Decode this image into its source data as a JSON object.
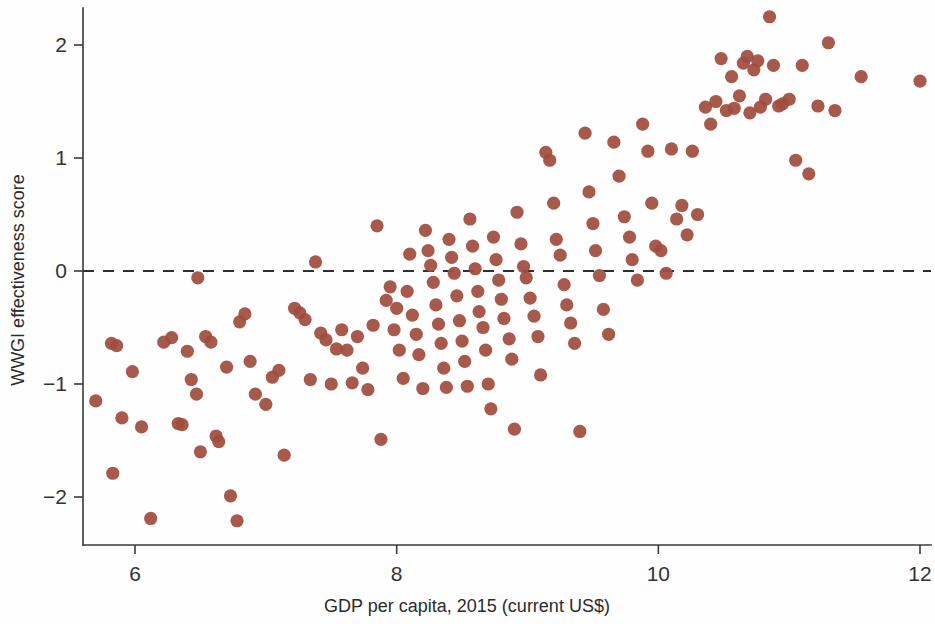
{
  "figure": {
    "background_color": "#fefefe",
    "point_color": "#a04c3d",
    "axis_color": "#3a3a3a",
    "point_radius": 6.6
  },
  "chart_data": {
    "type": "scatter",
    "title": "",
    "xlabel": "GDP per capita, 2015 (current US$)",
    "ylabel": "WWGI effectiveness score",
    "xlim": [
      5.6,
      12.1
    ],
    "ylim": [
      -2.35,
      2.45
    ],
    "xticks": [
      6,
      8,
      10,
      12
    ],
    "xtick_labels": [
      "6",
      "8",
      "10",
      "12"
    ],
    "yticks": [
      -2,
      -1,
      0,
      1,
      2
    ],
    "ytick_labels": [
      "−2",
      "−1",
      "0",
      "1",
      "2"
    ],
    "grid": false,
    "legend": null,
    "annotations": [
      {
        "type": "hline",
        "y": 0,
        "style": "dashed",
        "label": "zero reference line"
      }
    ],
    "series": [
      {
        "name": "Countries",
        "marker": "circle",
        "color": "#a04c3d",
        "points": [
          [
            5.7,
            -1.15
          ],
          [
            5.82,
            -0.64
          ],
          [
            5.86,
            -0.66
          ],
          [
            5.83,
            -1.79
          ],
          [
            5.9,
            -1.3
          ],
          [
            5.98,
            -0.89
          ],
          [
            6.05,
            -1.38
          ],
          [
            6.12,
            -2.19
          ],
          [
            6.22,
            -0.63
          ],
          [
            6.28,
            -0.59
          ],
          [
            6.33,
            -1.35
          ],
          [
            6.36,
            -1.36
          ],
          [
            6.4,
            -0.71
          ],
          [
            6.43,
            -0.96
          ],
          [
            6.48,
            -0.06
          ],
          [
            6.47,
            -1.09
          ],
          [
            6.5,
            -1.6
          ],
          [
            6.54,
            -0.58
          ],
          [
            6.58,
            -0.63
          ],
          [
            6.62,
            -1.46
          ],
          [
            6.64,
            -1.51
          ],
          [
            6.7,
            -0.85
          ],
          [
            6.73,
            -1.99
          ],
          [
            6.78,
            -2.21
          ],
          [
            6.8,
            -0.45
          ],
          [
            6.84,
            -0.38
          ],
          [
            6.88,
            -0.8
          ],
          [
            6.92,
            -1.09
          ],
          [
            7.0,
            -1.18
          ],
          [
            7.05,
            -0.94
          ],
          [
            7.1,
            -0.88
          ],
          [
            7.14,
            -1.63
          ],
          [
            7.22,
            -0.33
          ],
          [
            7.26,
            -0.37
          ],
          [
            7.3,
            -0.43
          ],
          [
            7.34,
            -0.96
          ],
          [
            7.38,
            0.08
          ],
          [
            7.42,
            -0.55
          ],
          [
            7.46,
            -0.61
          ],
          [
            7.5,
            -1.0
          ],
          [
            7.54,
            -0.69
          ],
          [
            7.58,
            -0.52
          ],
          [
            7.62,
            -0.7
          ],
          [
            7.66,
            -0.99
          ],
          [
            7.7,
            -0.58
          ],
          [
            7.74,
            -0.86
          ],
          [
            7.78,
            -1.05
          ],
          [
            7.82,
            -0.48
          ],
          [
            7.85,
            0.4
          ],
          [
            7.88,
            -1.49
          ],
          [
            7.92,
            -0.26
          ],
          [
            7.95,
            -0.14
          ],
          [
            7.98,
            -0.52
          ],
          [
            8.0,
            -0.33
          ],
          [
            8.02,
            -0.7
          ],
          [
            8.05,
            -0.95
          ],
          [
            8.08,
            -0.18
          ],
          [
            8.1,
            0.15
          ],
          [
            8.12,
            -0.39
          ],
          [
            8.15,
            -0.56
          ],
          [
            8.17,
            -0.74
          ],
          [
            8.2,
            -1.04
          ],
          [
            8.22,
            0.36
          ],
          [
            8.24,
            0.18
          ],
          [
            8.26,
            0.05
          ],
          [
            8.28,
            -0.1
          ],
          [
            8.3,
            -0.3
          ],
          [
            8.32,
            -0.47
          ],
          [
            8.34,
            -0.64
          ],
          [
            8.36,
            -0.86
          ],
          [
            8.38,
            -1.03
          ],
          [
            8.4,
            0.28
          ],
          [
            8.42,
            0.12
          ],
          [
            8.44,
            -0.02
          ],
          [
            8.46,
            -0.22
          ],
          [
            8.48,
            -0.44
          ],
          [
            8.5,
            -0.62
          ],
          [
            8.52,
            -0.8
          ],
          [
            8.54,
            -1.02
          ],
          [
            8.56,
            0.46
          ],
          [
            8.58,
            0.22
          ],
          [
            8.6,
            0.02
          ],
          [
            8.62,
            -0.18
          ],
          [
            8.63,
            -0.36
          ],
          [
            8.66,
            -0.5
          ],
          [
            8.68,
            -0.7
          ],
          [
            8.7,
            -1.0
          ],
          [
            8.72,
            -1.22
          ],
          [
            8.74,
            0.3
          ],
          [
            8.76,
            0.1
          ],
          [
            8.78,
            -0.08
          ],
          [
            8.8,
            -0.25
          ],
          [
            8.82,
            -0.42
          ],
          [
            8.86,
            -0.6
          ],
          [
            8.88,
            -0.78
          ],
          [
            8.9,
            -1.4
          ],
          [
            8.92,
            0.52
          ],
          [
            8.95,
            0.24
          ],
          [
            8.97,
            0.04
          ],
          [
            8.99,
            -0.06
          ],
          [
            9.02,
            -0.24
          ],
          [
            9.05,
            -0.4
          ],
          [
            9.08,
            -0.58
          ],
          [
            9.1,
            -0.92
          ],
          [
            9.14,
            1.05
          ],
          [
            9.17,
            0.98
          ],
          [
            9.2,
            0.6
          ],
          [
            9.22,
            0.28
          ],
          [
            9.25,
            0.14
          ],
          [
            9.28,
            -0.12
          ],
          [
            9.3,
            -0.3
          ],
          [
            9.33,
            -0.46
          ],
          [
            9.36,
            -0.64
          ],
          [
            9.4,
            -1.42
          ],
          [
            9.44,
            1.22
          ],
          [
            9.47,
            0.7
          ],
          [
            9.5,
            0.42
          ],
          [
            9.52,
            0.18
          ],
          [
            9.55,
            -0.04
          ],
          [
            9.58,
            -0.34
          ],
          [
            9.62,
            -0.56
          ],
          [
            9.66,
            1.14
          ],
          [
            9.7,
            0.84
          ],
          [
            9.74,
            0.48
          ],
          [
            9.78,
            0.3
          ],
          [
            9.8,
            0.1
          ],
          [
            9.84,
            -0.08
          ],
          [
            9.88,
            1.3
          ],
          [
            9.92,
            1.06
          ],
          [
            9.95,
            0.6
          ],
          [
            9.98,
            0.22
          ],
          [
            10.02,
            0.18
          ],
          [
            10.06,
            -0.02
          ],
          [
            10.1,
            1.08
          ],
          [
            10.14,
            0.46
          ],
          [
            10.18,
            0.58
          ],
          [
            10.22,
            0.32
          ],
          [
            10.26,
            1.06
          ],
          [
            10.3,
            0.5
          ],
          [
            10.36,
            1.45
          ],
          [
            10.4,
            1.3
          ],
          [
            10.44,
            1.5
          ],
          [
            10.48,
            1.88
          ],
          [
            10.52,
            1.42
          ],
          [
            10.56,
            1.72
          ],
          [
            10.58,
            1.44
          ],
          [
            10.62,
            1.55
          ],
          [
            10.65,
            1.84
          ],
          [
            10.68,
            1.9
          ],
          [
            10.7,
            1.4
          ],
          [
            10.73,
            1.78
          ],
          [
            10.76,
            1.86
          ],
          [
            10.78,
            1.45
          ],
          [
            10.82,
            1.52
          ],
          [
            10.85,
            2.25
          ],
          [
            10.88,
            1.82
          ],
          [
            10.92,
            1.46
          ],
          [
            10.95,
            1.48
          ],
          [
            11.0,
            1.52
          ],
          [
            11.05,
            0.98
          ],
          [
            11.1,
            1.82
          ],
          [
            11.15,
            0.86
          ],
          [
            11.22,
            1.46
          ],
          [
            11.3,
            2.02
          ],
          [
            11.35,
            1.42
          ],
          [
            11.55,
            1.72
          ],
          [
            12.0,
            1.68
          ]
        ]
      }
    ]
  }
}
